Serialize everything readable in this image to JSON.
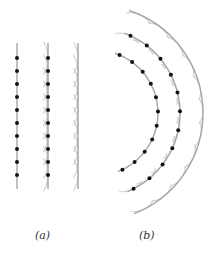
{
  "figure": {
    "panels": [
      {
        "id": "a",
        "label": "(a)",
        "kind": "plane-wavefronts",
        "wavefront_count": 3,
        "dotted_wavefronts": 2,
        "dots_per_wavefront": 10
      },
      {
        "id": "b",
        "label": "(b)",
        "kind": "circular-wavefronts",
        "wavefront_count": 3,
        "dotted_wavefronts": 2,
        "dots_per_wavefront": 11
      }
    ],
    "colors": {
      "wavefront": "#a6a6a6",
      "wavelet": "#cfcfcf",
      "dot": "#111111",
      "label": "#333333"
    }
  }
}
